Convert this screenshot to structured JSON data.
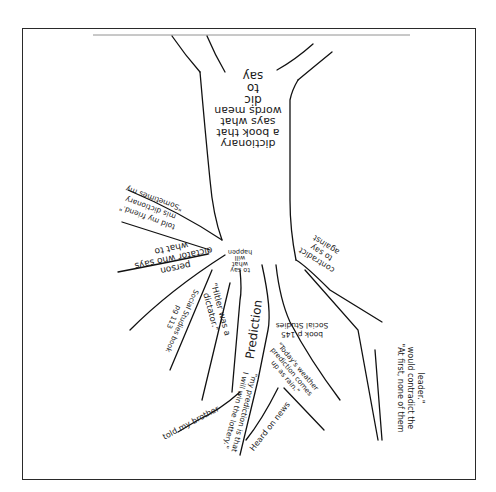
{
  "worksheet": {
    "type": "vocabulary word tree (hand-drawn)",
    "trunk": {
      "top_label": [
        "dic",
        "to",
        "say"
      ],
      "definition": [
        "dictionary",
        "a book that",
        "says what",
        "words mean"
      ]
    },
    "roots": [
      {
        "id": "root-meaning",
        "text": [
          "to say",
          "what",
          "will",
          "happen"
        ]
      },
      {
        "id": "contradict",
        "text": [
          "contradict",
          "to say",
          "against"
        ]
      },
      {
        "id": "prediction",
        "text": [
          "Prediction"
        ]
      },
      {
        "id": "dictator",
        "text": [
          "dictator who says",
          "what to",
          "do",
          "person"
        ]
      },
      {
        "id": "misdictionary",
        "text": [
          "\"Sometimes my",
          "mis dictionary",
          "told my friend.\""
        ]
      },
      {
        "id": "hitler",
        "text": [
          "\"Hitler was a",
          "dictator.\""
        ]
      },
      {
        "id": "social-studies-1",
        "text": [
          "Social Studies book",
          "pg 113"
        ]
      },
      {
        "id": "social-studies-2",
        "text": [
          "Social Studies",
          "book p 145"
        ]
      },
      {
        "id": "at-first",
        "text": [
          "\"At first, none of them",
          "would contradict the",
          "leader.\""
        ]
      },
      {
        "id": "my-prediction",
        "text": [
          "\"my prediction is that",
          "I will win the lottery.\""
        ]
      },
      {
        "id": "told-brother",
        "text": [
          "told my brother"
        ]
      },
      {
        "id": "todays-weather",
        "text": [
          "\"Today's weather",
          "prediction comes",
          "up as rain.\""
        ]
      },
      {
        "id": "heard-on-news",
        "text": [
          "Heard on news"
        ]
      }
    ]
  }
}
